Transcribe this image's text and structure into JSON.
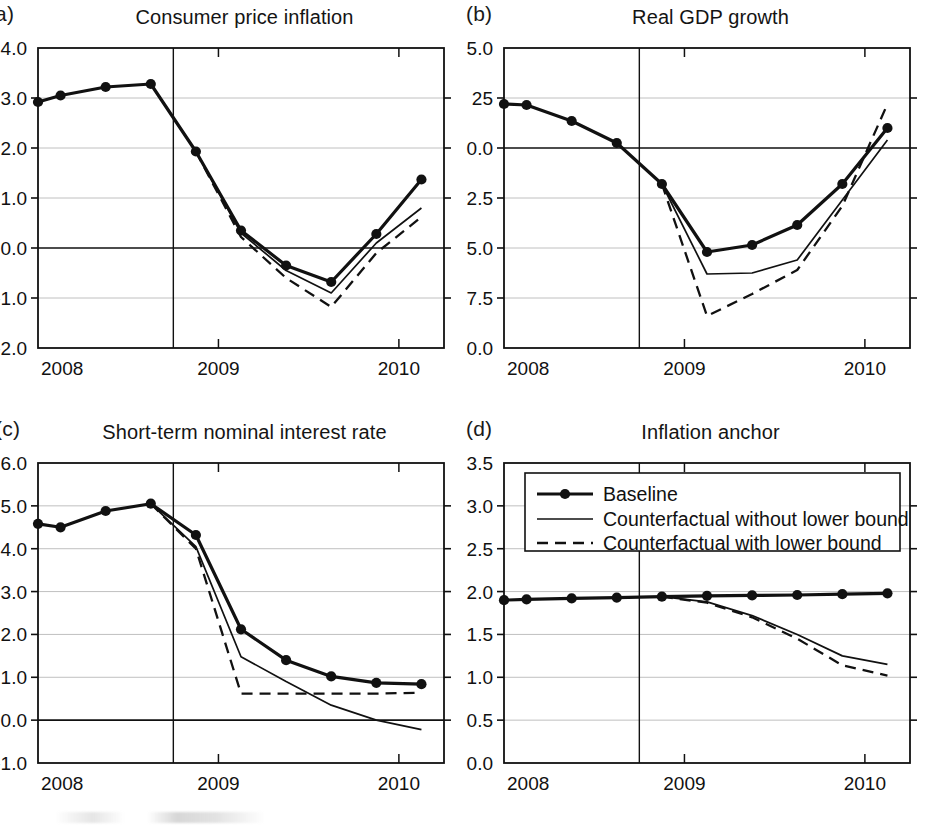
{
  "figure": {
    "background": "#ffffff",
    "line_color": "#111111",
    "grid_color": "#b9b9b9"
  },
  "panels": [
    {
      "id": "a",
      "letter": "a)",
      "title": "Consumer price inflation",
      "yticks": [
        "4.0",
        "3.0",
        "2.0",
        "1.0",
        "0.0",
        "-1.0",
        "-2.0"
      ],
      "xticks": [
        "2008",
        "2009",
        "2010"
      ]
    },
    {
      "id": "b",
      "letter": "(b)",
      "title": "Real GDP growth",
      "yticks": [
        "5.0",
        "25",
        "0.0",
        "-2.5",
        "-5.0",
        "-7.5",
        "-10.0"
      ],
      "xticks": [
        "2008",
        "2009",
        "2010"
      ]
    },
    {
      "id": "c",
      "letter": "(c)",
      "title": "Short-term nominal interest rate",
      "yticks": [
        "6.0",
        "5.0",
        "4.0",
        "3.0",
        "2.0",
        "1.0",
        "0.0",
        "-1.0"
      ],
      "xticks": [
        "2008",
        "2009",
        "2010"
      ]
    },
    {
      "id": "d",
      "letter": "(d)",
      "title": "Inflation anchor",
      "yticks": [
        "3.5",
        "3.0",
        "2.5",
        "2.0",
        "1.5",
        "1.0",
        "0.5",
        "0.0"
      ],
      "xticks": [
        "2008",
        "2009",
        "2010"
      ]
    }
  ],
  "legend": {
    "position": "top-left-inside-panel-d",
    "items": [
      {
        "label": "Baseline",
        "style": "solid-with-markers"
      },
      {
        "label": "Counterfactual without lower bound",
        "style": "solid"
      },
      {
        "label": "Counterfactual with lower bound",
        "style": "dashed"
      }
    ]
  },
  "chart_data": [
    {
      "type": "line",
      "panel": "a",
      "title": "Consumer price inflation",
      "xlabel": "",
      "ylabel": "",
      "xlim": [
        2008.0,
        2010.25
      ],
      "ylim": [
        -2.0,
        4.0
      ],
      "yticks": [
        4.0,
        3.0,
        2.0,
        1.0,
        0.0,
        -1.0,
        -2.0
      ],
      "xticks": [
        2008,
        2009,
        2010
      ],
      "grid": true,
      "vline": 2008.75,
      "x": [
        2008.0,
        2008.125,
        2008.375,
        2008.625,
        2008.875,
        2009.125,
        2009.375,
        2009.625,
        2009.875,
        2010.125
      ],
      "series": [
        {
          "name": "Baseline",
          "style": "solid-with-markers",
          "values": [
            2.92,
            3.05,
            3.22,
            3.28,
            1.93,
            0.35,
            -0.35,
            -0.68,
            0.28,
            1.37
          ]
        },
        {
          "name": "Counterfactual without lower bound",
          "style": "solid",
          "start_index": 4,
          "values": [
            null,
            null,
            null,
            null,
            1.93,
            0.3,
            -0.45,
            -0.9,
            0.1,
            0.8
          ]
        },
        {
          "name": "Counterfactual with lower bound",
          "style": "dashed",
          "start_index": 4,
          "values": [
            null,
            null,
            null,
            null,
            1.93,
            0.22,
            -0.6,
            -1.18,
            -0.1,
            0.62
          ]
        }
      ]
    },
    {
      "type": "line",
      "panel": "b",
      "title": "Real GDP growth",
      "xlabel": "",
      "ylabel": "",
      "xlim": [
        2008.0,
        2010.25
      ],
      "ylim": [
        -10.0,
        5.0
      ],
      "yticks": [
        5.0,
        2.5,
        0.0,
        -2.5,
        -5.0,
        -7.5,
        -10.0
      ],
      "xticks": [
        2008,
        2009,
        2010
      ],
      "grid": true,
      "vline": 2008.75,
      "x": [
        2008.0,
        2008.125,
        2008.375,
        2008.625,
        2008.875,
        2009.125,
        2009.375,
        2009.625,
        2009.875,
        2010.125
      ],
      "series": [
        {
          "name": "Baseline",
          "style": "solid-with-markers",
          "values": [
            2.2,
            2.15,
            1.35,
            0.25,
            -1.8,
            -5.2,
            -4.85,
            -3.85,
            -1.8,
            1.0
          ]
        },
        {
          "name": "Counterfactual without lower bound",
          "style": "solid",
          "start_index": 4,
          "values": [
            null,
            null,
            null,
            null,
            -1.8,
            -6.3,
            -6.25,
            -5.6,
            -2.6,
            0.4
          ]
        },
        {
          "name": "Counterfactual with lower bound",
          "style": "dashed",
          "start_index": 4,
          "values": [
            null,
            null,
            null,
            null,
            -1.8,
            -8.4,
            -7.3,
            -6.1,
            -2.9,
            2.2
          ]
        }
      ]
    },
    {
      "type": "line",
      "panel": "c",
      "title": "Short-term nominal interest rate",
      "xlabel": "",
      "ylabel": "",
      "xlim": [
        2008.0,
        2010.25
      ],
      "ylim": [
        -1.0,
        6.0
      ],
      "yticks": [
        6.0,
        5.0,
        4.0,
        3.0,
        2.0,
        1.0,
        0.0,
        -1.0
      ],
      "xticks": [
        2008,
        2009,
        2010
      ],
      "grid": true,
      "vline": 2008.75,
      "x": [
        2008.0,
        2008.125,
        2008.375,
        2008.625,
        2008.875,
        2009.125,
        2009.375,
        2009.625,
        2009.875,
        2010.125
      ],
      "series": [
        {
          "name": "Baseline",
          "style": "solid-with-markers",
          "values": [
            4.58,
            4.5,
            4.88,
            5.05,
            4.32,
            2.12,
            1.4,
            1.02,
            0.87,
            0.84
          ]
        },
        {
          "name": "Counterfactual without lower bound",
          "style": "solid",
          "start_index": 3,
          "values": [
            null,
            null,
            null,
            5.05,
            4.05,
            1.48,
            0.9,
            0.35,
            0.0,
            -0.22
          ]
        },
        {
          "name": "Counterfactual with lower bound",
          "style": "dashed",
          "start_index": 3,
          "values": [
            null,
            null,
            null,
            5.05,
            4.0,
            0.62,
            0.62,
            0.62,
            0.62,
            0.64
          ]
        }
      ]
    },
    {
      "type": "line",
      "panel": "d",
      "title": "Inflation anchor",
      "xlabel": "",
      "ylabel": "",
      "xlim": [
        2008.0,
        2010.25
      ],
      "ylim": [
        0.0,
        3.5
      ],
      "yticks": [
        3.5,
        3.0,
        2.5,
        2.0,
        1.5,
        1.0,
        0.5,
        0.0
      ],
      "xticks": [
        2008,
        2009,
        2010
      ],
      "grid": true,
      "vline": 2008.75,
      "x": [
        2008.0,
        2008.125,
        2008.375,
        2008.625,
        2008.875,
        2009.125,
        2009.375,
        2009.625,
        2009.875,
        2010.125
      ],
      "series": [
        {
          "name": "Baseline",
          "style": "solid-with-markers",
          "values": [
            1.9,
            1.91,
            1.92,
            1.93,
            1.94,
            1.95,
            1.955,
            1.96,
            1.97,
            1.98
          ]
        },
        {
          "name": "Counterfactual without lower bound",
          "style": "solid",
          "start_index": 4,
          "values": [
            null,
            null,
            null,
            null,
            1.94,
            1.88,
            1.72,
            1.5,
            1.25,
            1.15
          ]
        },
        {
          "name": "Counterfactual with lower bound",
          "style": "dashed",
          "start_index": 4,
          "values": [
            null,
            null,
            null,
            null,
            1.94,
            1.87,
            1.7,
            1.45,
            1.14,
            1.02
          ]
        }
      ]
    }
  ]
}
